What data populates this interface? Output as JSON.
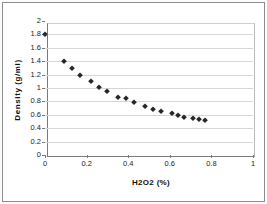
{
  "chart_data": {
    "type": "scatter",
    "title": "",
    "xlabel": "H2O2 (%)",
    "ylabel": "Density (g/ml)",
    "xlim": [
      0,
      1
    ],
    "ylim": [
      0,
      2
    ],
    "x_ticks": [
      0,
      0.2,
      0.4,
      0.6,
      0.8,
      1
    ],
    "x_tick_labels": [
      "0",
      "0.2",
      "0.4",
      "0.6",
      "0.8",
      "1"
    ],
    "y_ticks": [
      0,
      0.2,
      0.4,
      0.6,
      0.8,
      1,
      1.2,
      1.4,
      1.6,
      1.8,
      2
    ],
    "y_tick_labels": [
      "0",
      "0.2",
      "0.4",
      "0.6",
      "0.8",
      "1",
      "1.2",
      "1.4",
      "1.6",
      "1.8",
      "2"
    ],
    "grid": "horizontal-only",
    "legend": "none",
    "marker_shape": "diamond",
    "points": [
      [
        0.0,
        1.8
      ],
      [
        0.09,
        1.4
      ],
      [
        0.13,
        1.3
      ],
      [
        0.17,
        1.2
      ],
      [
        0.22,
        1.1
      ],
      [
        0.26,
        1.02
      ],
      [
        0.3,
        0.95
      ],
      [
        0.35,
        0.87
      ],
      [
        0.39,
        0.85
      ],
      [
        0.43,
        0.79
      ],
      [
        0.48,
        0.73
      ],
      [
        0.52,
        0.68
      ],
      [
        0.56,
        0.66
      ],
      [
        0.61,
        0.62
      ],
      [
        0.64,
        0.6
      ],
      [
        0.67,
        0.56
      ],
      [
        0.71,
        0.55
      ],
      [
        0.74,
        0.54
      ],
      [
        0.77,
        0.52
      ]
    ],
    "colors": {
      "marker": "#262626",
      "gridline": "#d6d6d6",
      "axis": "#7a7a7a",
      "frame": "#8c8c8c",
      "background": "#ffffff"
    }
  }
}
